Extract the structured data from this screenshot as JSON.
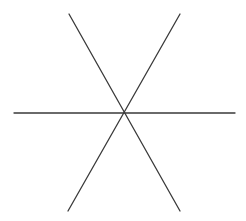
{
  "diagram": {
    "background": "#ffffff",
    "stroke_color": "#3a3a3a",
    "stroke_width": 1.3,
    "center": [
      123,
      113
    ],
    "lines": [
      {
        "name": "horizontal-line",
        "x1": 14,
        "y1": 113,
        "x2": 235,
        "y2": 113
      },
      {
        "name": "diagonal-line-descending",
        "x1": 69,
        "y1": 14,
        "x2": 180,
        "y2": 211
      },
      {
        "name": "diagonal-line-ascending",
        "x1": 180,
        "y1": 14,
        "x2": 68,
        "y2": 211
      }
    ]
  }
}
